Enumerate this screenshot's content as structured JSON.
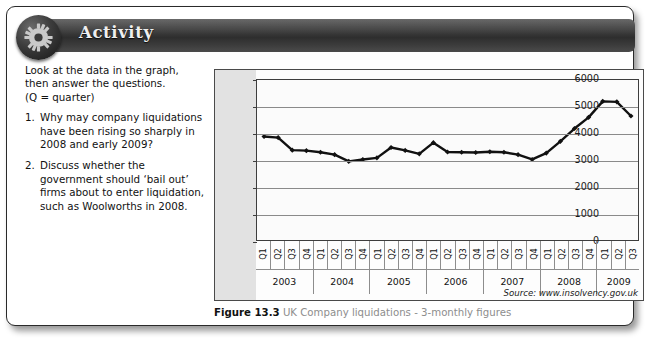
{
  "header": {
    "title": "Activity",
    "icon": "gear-icon"
  },
  "questions": {
    "intro_line1": "Look at the data in the graph,",
    "intro_line2": "then answer the questions.",
    "intro_line3": "(Q = quarter)",
    "items": [
      {
        "num": "1.",
        "text": "Why may company liquidations have been rising so sharply in 2008 and early 2009?"
      },
      {
        "num": "2.",
        "text": "Discuss whether the government should ‘bail out’ firms about to enter liquidation, such as Woolworths in 2008."
      }
    ]
  },
  "figure": {
    "label": "Figure 13.3",
    "caption": "UK Company liquidations - 3-monthly figures",
    "source": "Source: www.insolvency.gov.uk"
  },
  "chart_data": {
    "type": "line",
    "title": "UK Company liquidations - 3-monthly figures",
    "xlabel": "",
    "ylabel": "",
    "ylim": [
      0,
      6000
    ],
    "yticks": [
      0,
      1000,
      2000,
      3000,
      4000,
      5000,
      6000
    ],
    "ytick_labels": [
      "0",
      "1000",
      "2000",
      "3000",
      "4000",
      "5000",
      "6000"
    ],
    "grid": true,
    "legend": "none",
    "marker": "diamond",
    "line_color": "#111111",
    "years": [
      "2003",
      "2004",
      "2005",
      "2006",
      "2007",
      "2008",
      "2009"
    ],
    "quarters_per_year": [
      4,
      4,
      4,
      4,
      4,
      4,
      3
    ],
    "quarter_labels": [
      "Q1",
      "Q2",
      "Q3",
      "Q4"
    ],
    "categories": [
      "2003 Q1",
      "2003 Q2",
      "2003 Q3",
      "2003 Q4",
      "2004 Q1",
      "2004 Q2",
      "2004 Q3",
      "2004 Q4",
      "2005 Q1",
      "2005 Q2",
      "2005 Q3",
      "2005 Q4",
      "2006 Q1",
      "2006 Q2",
      "2006 Q3",
      "2006 Q4",
      "2007 Q1",
      "2007 Q2",
      "2007 Q3",
      "2007 Q4",
      "2008 Q1",
      "2008 Q2",
      "2008 Q3",
      "2008 Q4",
      "2009 Q1",
      "2009 Q2",
      "2009 Q3"
    ],
    "values": [
      3880,
      3840,
      3370,
      3350,
      3290,
      3200,
      2950,
      3020,
      3080,
      3470,
      3360,
      3230,
      3650,
      3300,
      3290,
      3280,
      3310,
      3290,
      3200,
      3020,
      3260,
      3700,
      4180,
      4600,
      5200,
      5180,
      4650
    ]
  }
}
